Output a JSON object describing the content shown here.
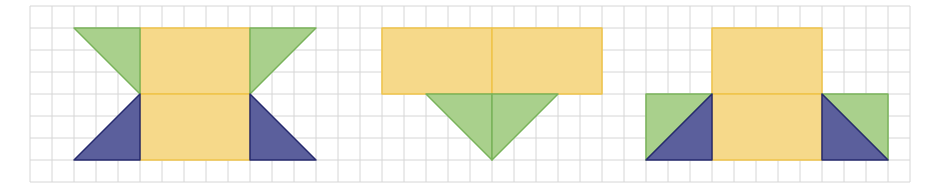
{
  "grid": {
    "origin_x": 30,
    "origin_y": 6,
    "cell": 22,
    "cols": 40,
    "rows": 8,
    "line_color": "#d6d6d6",
    "background": "#ffffff"
  },
  "colors": {
    "yellow_fill": "#f6d98a",
    "yellow_stroke": "#efc44a",
    "green_fill": "#a9d08c",
    "green_stroke": "#79b35a",
    "blue_fill": "#5b5f9c",
    "blue_stroke": "#262a6e"
  },
  "figures": [
    {
      "name": "figure-left",
      "shapes": [
        {
          "kind": "yellow",
          "points": [
            [
              5,
              1
            ],
            [
              10,
              1
            ],
            [
              10,
              4
            ],
            [
              5,
              4
            ]
          ]
        },
        {
          "kind": "yellow",
          "points": [
            [
              5,
              4
            ],
            [
              10,
              4
            ],
            [
              10,
              7
            ],
            [
              5,
              7
            ]
          ]
        },
        {
          "kind": "green",
          "points": [
            [
              2,
              1
            ],
            [
              5,
              1
            ],
            [
              5,
              4
            ]
          ]
        },
        {
          "kind": "green",
          "points": [
            [
              10,
              1
            ],
            [
              13,
              1
            ],
            [
              10,
              4
            ]
          ]
        },
        {
          "kind": "blue",
          "points": [
            [
              5,
              4
            ],
            [
              5,
              7
            ],
            [
              2,
              7
            ]
          ]
        },
        {
          "kind": "blue",
          "points": [
            [
              10,
              4
            ],
            [
              13,
              7
            ],
            [
              10,
              7
            ]
          ]
        }
      ]
    },
    {
      "name": "figure-middle",
      "shapes": [
        {
          "kind": "yellow",
          "points": [
            [
              16,
              1
            ],
            [
              21,
              1
            ],
            [
              21,
              4
            ],
            [
              16,
              4
            ]
          ]
        },
        {
          "kind": "yellow",
          "points": [
            [
              21,
              1
            ],
            [
              26,
              1
            ],
            [
              26,
              4
            ],
            [
              21,
              4
            ]
          ]
        },
        {
          "kind": "green",
          "points": [
            [
              18,
              4
            ],
            [
              21,
              4
            ],
            [
              21,
              7
            ]
          ]
        },
        {
          "kind": "green",
          "points": [
            [
              21,
              4
            ],
            [
              24,
              4
            ],
            [
              21,
              7
            ]
          ]
        }
      ]
    },
    {
      "name": "figure-right",
      "shapes": [
        {
          "kind": "yellow",
          "points": [
            [
              31,
              1
            ],
            [
              36,
              1
            ],
            [
              36,
              4
            ],
            [
              31,
              4
            ]
          ]
        },
        {
          "kind": "yellow",
          "points": [
            [
              31,
              4
            ],
            [
              36,
              4
            ],
            [
              36,
              7
            ],
            [
              31,
              7
            ]
          ]
        },
        {
          "kind": "green",
          "points": [
            [
              28,
              4
            ],
            [
              31,
              4
            ],
            [
              28,
              7
            ]
          ]
        },
        {
          "kind": "blue",
          "points": [
            [
              31,
              4
            ],
            [
              31,
              7
            ],
            [
              28,
              7
            ]
          ]
        },
        {
          "kind": "green",
          "points": [
            [
              36,
              4
            ],
            [
              39,
              4
            ],
            [
              39,
              7
            ]
          ]
        },
        {
          "kind": "blue",
          "points": [
            [
              36,
              4
            ],
            [
              39,
              7
            ],
            [
              36,
              7
            ]
          ]
        }
      ]
    }
  ]
}
